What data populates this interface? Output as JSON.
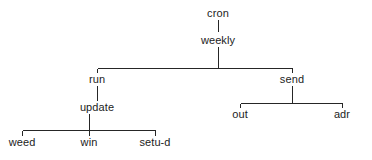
{
  "diagram": {
    "type": "tree",
    "background_color": "#ffffff",
    "line_color": "#262626",
    "text_color": "#1c1c1c",
    "nodes": [
      {
        "id": "cron",
        "label": "cron",
        "level": 0,
        "x": 218,
        "y": 14,
        "parent": null
      },
      {
        "id": "weekly",
        "label": "weekly",
        "level": 1,
        "x": 218,
        "y": 41,
        "parent": "cron"
      },
      {
        "id": "run",
        "label": "run",
        "level": 2,
        "x": 97,
        "y": 80,
        "parent": "weekly"
      },
      {
        "id": "send",
        "label": "send",
        "level": 2,
        "x": 292,
        "y": 80,
        "parent": "weekly"
      },
      {
        "id": "update",
        "label": "update",
        "level": 3,
        "x": 97,
        "y": 108,
        "parent": "run"
      },
      {
        "id": "out",
        "label": "out",
        "level": 3,
        "x": 240,
        "y": 115,
        "parent": "send"
      },
      {
        "id": "adr",
        "label": "adr",
        "level": 3,
        "x": 342,
        "y": 115,
        "parent": "send"
      },
      {
        "id": "weed",
        "label": "weed",
        "level": 4,
        "x": 22,
        "y": 143,
        "parent": "update"
      },
      {
        "id": "win",
        "label": "win",
        "level": 4,
        "x": 89,
        "y": 143,
        "parent": "update"
      },
      {
        "id": "setu-d",
        "label": "setu-d",
        "level": 4,
        "x": 155,
        "y": 143,
        "parent": "update"
      }
    ],
    "edges": [
      {
        "from": "cron",
        "to": "weekly",
        "kind": "vertical"
      },
      {
        "from": "weekly",
        "to": "run",
        "kind": "elbow"
      },
      {
        "from": "weekly",
        "to": "send",
        "kind": "elbow"
      },
      {
        "from": "run",
        "to": "update",
        "kind": "vertical"
      },
      {
        "from": "update",
        "to": "weed",
        "kind": "elbow"
      },
      {
        "from": "update",
        "to": "win",
        "kind": "elbow"
      },
      {
        "from": "update",
        "to": "setu-d",
        "kind": "elbow"
      },
      {
        "from": "send",
        "to": "out",
        "kind": "elbow"
      },
      {
        "from": "send",
        "to": "adr",
        "kind": "elbow"
      }
    ]
  }
}
